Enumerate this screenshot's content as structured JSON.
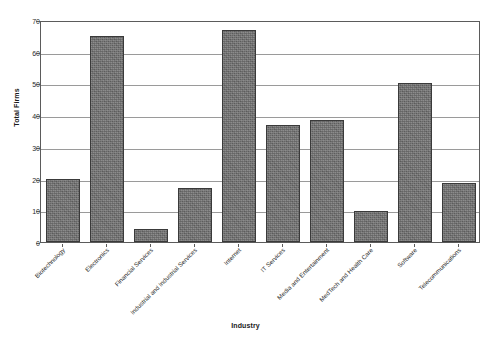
{
  "chart_data": {
    "type": "bar",
    "title": "",
    "xlabel": "Industry",
    "ylabel": "Total Firms",
    "ylim": [
      0,
      70
    ],
    "ytick_step": 10,
    "yticks": [
      0,
      10,
      20,
      30,
      40,
      50,
      60,
      70
    ],
    "grid": true,
    "legend": "none",
    "bar_color": "#6e6e6e",
    "bar_edge_color": "#3a3a3a",
    "axis_color": "#5b5b5b",
    "gridline_color": "#9a9a9a",
    "background": "#ffffff",
    "categories": [
      "Biotechnology",
      "Electronics",
      "Financial Services",
      "Industrial and Industrial Services",
      "Internet",
      "IT Services",
      "Media and Entertainment",
      "MedTech and Health Care",
      "Software",
      "Telecommunications"
    ],
    "values": [
      20,
      65,
      4,
      17,
      67,
      37,
      38.5,
      9.8,
      50,
      18.5
    ]
  },
  "axes": {
    "y_title": "Total Firms",
    "x_title": "Industry"
  },
  "header": {
    "clipped_text": ""
  }
}
